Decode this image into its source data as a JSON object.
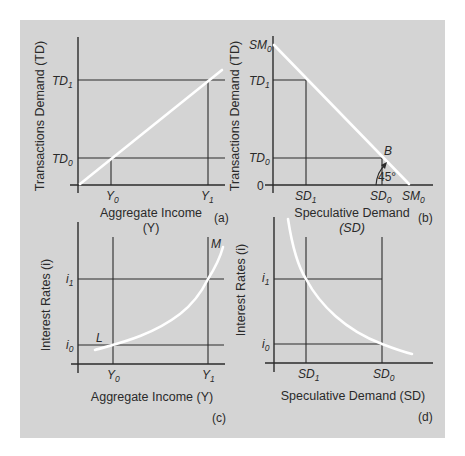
{
  "figure": {
    "background_color": "#d4d4d4",
    "curve_color": "#ffffff",
    "line_color": "#2b2b2b"
  },
  "panels": {
    "a": {
      "tag": "(a)",
      "y_axis_label": "Transactions Demand (TD)",
      "x_axis_label_line1": "Aggregate Income",
      "x_axis_label_line2": "(Y)",
      "y_ticks": [
        {
          "base": "TD",
          "sub": "1"
        },
        {
          "base": "TD",
          "sub": "0"
        }
      ],
      "x_ticks": [
        {
          "base": "Y",
          "sub": "0"
        },
        {
          "base": "Y",
          "sub": "1"
        }
      ],
      "curve": "upward-sloping straight line from origin"
    },
    "b": {
      "tag": "(b)",
      "y_axis_label": "Transactions Demand (TD)",
      "x_axis_label_line1": "Speculative Demand",
      "x_axis_label_line2": "(SD)",
      "y_ticks": [
        {
          "base": "SM",
          "sub": "0"
        },
        {
          "base": "TD",
          "sub": "1"
        },
        {
          "base": "TD",
          "sub": "0"
        },
        {
          "base": "0",
          "sub": ""
        }
      ],
      "x_ticks": [
        {
          "base": "SD",
          "sub": "1"
        },
        {
          "base": "SD",
          "sub": "0"
        },
        {
          "base": "SM",
          "sub": "0"
        }
      ],
      "point_label": "B",
      "angle_label": "45°",
      "curve": "downward-sloping 45-degree line from SM0 to SM0"
    },
    "c": {
      "tag": "(c)",
      "y_axis_label": "Interest Rates (i)",
      "x_axis_label": "Aggregate Income (Y)",
      "y_ticks": [
        {
          "base": "i",
          "sub": "1"
        },
        {
          "base": "i",
          "sub": "0"
        }
      ],
      "x_ticks": [
        {
          "base": "Y",
          "sub": "0"
        },
        {
          "base": "Y",
          "sub": "1"
        }
      ],
      "curve_start_label": "L",
      "curve_end_label": "M",
      "curve": "convex upward-sloping LM curve"
    },
    "d": {
      "tag": "(d)",
      "y_axis_label": "Interest Rates (i)",
      "x_axis_label": "Speculative Demand (SD)",
      "y_ticks": [
        {
          "base": "i",
          "sub": "1"
        },
        {
          "base": "i",
          "sub": "0"
        }
      ],
      "x_ticks": [
        {
          "base": "SD",
          "sub": "1"
        },
        {
          "base": "SD",
          "sub": "0"
        }
      ],
      "curve": "convex downward-sloping speculative demand curve"
    }
  }
}
